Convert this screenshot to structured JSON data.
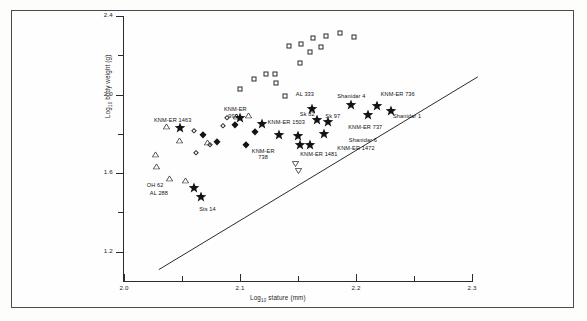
{
  "figure": {
    "kind": "scatter-plot",
    "background_color": "#fdfdfc",
    "frame_color": "#4b4b4b",
    "axis_color": "#2b2b2b",
    "marker_color": "#131313"
  },
  "chart_data": {
    "type": "scatter",
    "title": "",
    "xlabel": "Log10 stature (mm)",
    "ylabel": "Log10 body weight (g)",
    "xlabel_parts": {
      "prefix": "Log",
      "sub": "10",
      "suffix": " stature (mm)"
    },
    "ylabel_parts": {
      "prefix": "Log",
      "sub": "10",
      "suffix": " body weight (g)"
    },
    "xlim": [
      2.0,
      2.3
    ],
    "ylim": [
      1.05,
      2.4
    ],
    "grid": false,
    "legend": "none",
    "x_major_ticks": [
      "2.0",
      "2.1",
      "2.2",
      "2.3"
    ],
    "x_major_values": [
      2.0,
      2.1,
      2.2,
      2.3
    ],
    "x_minor_values": [
      2.05,
      2.15,
      2.25
    ],
    "y_major_ticks": [
      "2.4",
      "2.0",
      "1.6",
      "1.2"
    ],
    "y_major_values": [
      2.4,
      2.0,
      1.6,
      1.2
    ],
    "y_minor_values": [
      2.2,
      1.8,
      1.4
    ],
    "series": [
      {
        "name": "open-square",
        "marker": "open-square",
        "points": [
          [
            2.142,
            2.245
          ],
          [
            2.153,
            2.255
          ],
          [
            2.163,
            2.29
          ],
          [
            2.174,
            2.3
          ],
          [
            2.186,
            2.315
          ],
          [
            2.198,
            2.292
          ],
          [
            2.16,
            2.215
          ],
          [
            2.17,
            2.24
          ],
          [
            2.152,
            2.16
          ],
          [
            2.122,
            2.105
          ],
          [
            2.13,
            2.105
          ],
          [
            2.112,
            2.078
          ],
          [
            2.131,
            2.06
          ],
          [
            2.1,
            2.03
          ],
          [
            2.139,
            1.995
          ]
        ]
      },
      {
        "name": "open-triangle",
        "marker": "open-triangle",
        "points": [
          [
            2.036,
            1.822
          ],
          [
            2.048,
            1.755
          ],
          [
            2.027,
            1.68
          ],
          [
            2.028,
            1.622
          ],
          [
            2.039,
            1.56
          ],
          [
            2.053,
            1.548
          ],
          [
            2.072,
            1.745
          ],
          [
            2.097,
            1.873
          ],
          [
            2.107,
            1.878
          ]
        ]
      },
      {
        "name": "open-diamond",
        "marker": "open-diamond",
        "points": [
          [
            2.06,
            1.812
          ],
          [
            2.085,
            1.84
          ],
          [
            2.089,
            1.878
          ],
          [
            2.074,
            1.742
          ],
          [
            2.062,
            1.7
          ]
        ]
      },
      {
        "name": "filled-diamond",
        "marker": "filled-diamond",
        "points": [
          [
            2.068,
            1.795
          ],
          [
            2.096,
            1.845
          ],
          [
            2.08,
            1.76
          ],
          [
            2.113,
            1.808
          ],
          [
            2.105,
            1.742
          ]
        ]
      },
      {
        "name": "open-down-triangle",
        "marker": "open-down-triangle",
        "points": [
          [
            2.148,
            1.648
          ],
          [
            2.15,
            1.61
          ]
        ]
      },
      {
        "name": "filled-star",
        "marker": "filled-star",
        "points": [
          [
            2.048,
            1.828
          ],
          [
            2.06,
            1.522
          ],
          [
            2.066,
            1.478
          ],
          [
            2.1,
            1.88
          ],
          [
            2.119,
            1.848
          ],
          [
            2.134,
            1.795
          ],
          [
            2.15,
            1.79
          ],
          [
            2.152,
            1.745
          ],
          [
            2.16,
            1.742
          ],
          [
            2.166,
            1.868
          ],
          [
            2.176,
            1.862
          ],
          [
            2.172,
            1.8
          ],
          [
            2.162,
            1.928
          ],
          [
            2.196,
            1.948
          ],
          [
            2.218,
            1.94
          ],
          [
            2.21,
            1.895
          ],
          [
            2.23,
            1.918
          ]
        ]
      }
    ],
    "regression_line": {
      "x_start": 2.03,
      "y_start": 1.108,
      "x_end": 2.305,
      "y_end": 2.09,
      "style": "solid",
      "color": "#2b2b2b"
    },
    "annotations": [
      {
        "text": "KNM-ER 1463",
        "x": 2.042,
        "y": 1.884,
        "align": "center"
      },
      {
        "text": "OH 62",
        "x": 2.034,
        "y": 1.556,
        "align": "right"
      },
      {
        "text": "AL 288",
        "x": 2.038,
        "y": 1.512,
        "align": "right"
      },
      {
        "text": "Sts 14",
        "x": 2.072,
        "y": 1.432,
        "align": "center"
      },
      {
        "text": "KNM-ER",
        "x": 2.096,
        "y": 1.94,
        "align": "center"
      },
      {
        "text": "993",
        "x": 2.094,
        "y": 1.908,
        "align": "center"
      },
      {
        "text": "KNM-ER 1503",
        "x": 2.14,
        "y": 1.876,
        "align": "center"
      },
      {
        "text": "KNM-ER",
        "x": 2.12,
        "y": 1.728,
        "align": "center"
      },
      {
        "text": "738",
        "x": 2.12,
        "y": 1.698,
        "align": "center"
      },
      {
        "text": "AL 333",
        "x": 2.156,
        "y": 2.02,
        "align": "center"
      },
      {
        "text": "Sk 82",
        "x": 2.158,
        "y": 1.918,
        "align": "center"
      },
      {
        "text": "Sk 97",
        "x": 2.18,
        "y": 1.908,
        "align": "center"
      },
      {
        "text": "KNM-ER 1481",
        "x": 2.168,
        "y": 1.712,
        "align": "center"
      },
      {
        "text": "KNM-ER 1472",
        "x": 2.2,
        "y": 1.744,
        "align": "center"
      },
      {
        "text": "Shanidar 6",
        "x": 2.206,
        "y": 1.782,
        "align": "center"
      },
      {
        "text": "Shanidar 4",
        "x": 2.196,
        "y": 2.01,
        "align": "center"
      },
      {
        "text": "KNM-ER 736",
        "x": 2.236,
        "y": 2.018,
        "align": "center"
      },
      {
        "text": "Shanidar 1",
        "x": 2.244,
        "y": 1.906,
        "align": "center"
      },
      {
        "text": "KNM-ER 737",
        "x": 2.208,
        "y": 1.85,
        "align": "center"
      }
    ]
  }
}
